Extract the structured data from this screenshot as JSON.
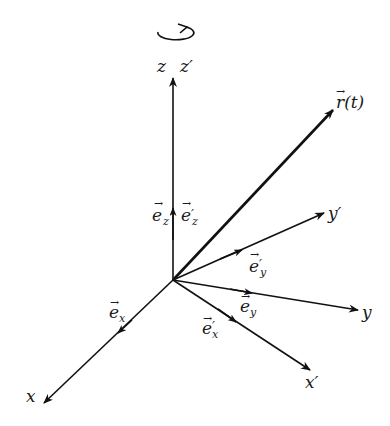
{
  "diagram": {
    "type": "3D rotating coordinate frames",
    "rotation_indicator": "circular arrow about z-axis",
    "labels": {
      "z": "z",
      "z_prime": "z′",
      "x": "x",
      "x_prime": "x′",
      "y": "y",
      "y_prime": "y′",
      "r_t": "r⃗(t)",
      "r_t_base": "r",
      "r_t_arg": "(t)",
      "e": "e",
      "ez_sub": "z",
      "ez_prime_sub": "z",
      "ey_sub": "y",
      "ey_prime_sub": "y",
      "ex_sub": "x",
      "ex_prime_sub": "x",
      "prime": "′",
      "arrow": "→"
    },
    "colors": {
      "stroke": "#111111",
      "background": "#ffffff"
    }
  }
}
